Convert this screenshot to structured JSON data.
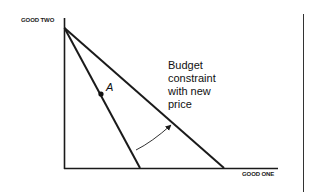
{
  "figure": {
    "type": "budget-constraint-diagram",
    "axes": {
      "y_label": "GOOD TWO",
      "x_label": "GOOD ONE"
    },
    "lines": [
      {
        "name": "original-budget-constraint",
        "from": [
          64,
          28
        ],
        "to": [
          140,
          168
        ]
      },
      {
        "name": "new-budget-constraint",
        "from": [
          64,
          28
        ],
        "to": [
          224,
          168
        ]
      }
    ],
    "point": {
      "label": "A",
      "x": 101,
      "y": 93
    },
    "annotation": {
      "lines": [
        "Budget",
        "constraint",
        "with new",
        "price"
      ]
    },
    "arrow": {
      "from": [
        136,
        150
      ],
      "to": [
        171,
        125
      ],
      "meaning": "rotation-outward"
    },
    "colors": {
      "line": "#1a1a1a",
      "background": "#ffffff",
      "page_border": "#333333"
    }
  }
}
